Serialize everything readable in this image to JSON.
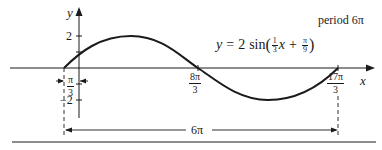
{
  "diagram": {
    "type": "function-graph",
    "equation": {
      "lhs": "y",
      "equals": "=",
      "coef": "2",
      "func": "sin",
      "open_paren": "(",
      "frac1_num": "1",
      "frac1_den": "3",
      "var": "x",
      "plus": "+",
      "frac2_num": "π",
      "frac2_den": "9",
      "close_paren": ")"
    },
    "period_label": "period 6π",
    "axes": {
      "x_label": "x",
      "y_label": "y",
      "y_ticks": [
        "2",
        "−2"
      ]
    },
    "x_markers": [
      {
        "id": "start",
        "num": "π",
        "den": "3",
        "sign": "−",
        "note": "phase shift width"
      },
      {
        "id": "mid",
        "num": "8π",
        "den": "3"
      },
      {
        "id": "end",
        "num": "17π",
        "den": "3"
      }
    ],
    "dimension": {
      "label": "6π"
    },
    "colors": {
      "ink": "#1a1a1a",
      "background": "#ffffff"
    }
  }
}
